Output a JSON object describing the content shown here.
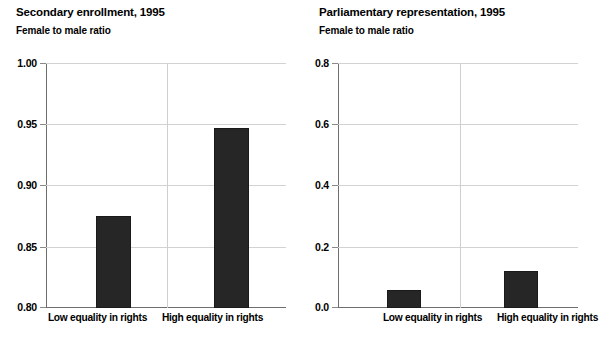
{
  "figure": {
    "background": "#ffffff",
    "bar_color": "#262626",
    "gridline_color": "#d2d2d2",
    "axis_color": "#6e6e6e"
  },
  "panels": [
    {
      "id": "secondary-enrollment",
      "title": "Secondary enrollment, 1995",
      "subtitle": "Female to male ratio",
      "y_ticks": [
        "1.00",
        "0.95",
        "0.90",
        "0.85",
        "0.80"
      ],
      "x_labels": [
        "Low equality in rights",
        "High equality in rights"
      ]
    },
    {
      "id": "parliamentary-representation",
      "title": "Parliamentary representation, 1995",
      "subtitle": "Female to male ratio",
      "y_ticks": [
        "0.8",
        "0.6",
        "0.4",
        "0.2",
        "0.0"
      ],
      "x_labels": [
        "Low equality in rights",
        "High equality in rights"
      ]
    }
  ],
  "chart_data": [
    {
      "type": "bar",
      "title": "Secondary enrollment, 1995",
      "subtitle": "Female to male ratio",
      "xlabel": "",
      "ylabel": "Female to male ratio",
      "categories": [
        "Low equality in rights",
        "High equality in rights"
      ],
      "values": [
        0.875,
        0.947
      ],
      "ylim": [
        0.8,
        1.0
      ],
      "ytick_values": [
        0.8,
        0.85,
        0.9,
        0.95,
        1.0
      ],
      "ytick_labels": [
        "0.80",
        "0.85",
        "0.90",
        "0.95",
        "1.00"
      ],
      "grid": true,
      "legend": "none"
    },
    {
      "type": "bar",
      "title": "Parliamentary representation, 1995",
      "subtitle": "Female to male ratio",
      "xlabel": "",
      "ylabel": "Female to male ratio",
      "categories": [
        "Low equality in rights",
        "High equality in rights"
      ],
      "values": [
        0.06,
        0.12
      ],
      "ylim": [
        0.0,
        0.8
      ],
      "ytick_values": [
        0.0,
        0.2,
        0.4,
        0.6,
        0.8
      ],
      "ytick_labels": [
        "0.0",
        "0.2",
        "0.4",
        "0.6",
        "0.8"
      ],
      "grid": true,
      "legend": "none"
    }
  ]
}
